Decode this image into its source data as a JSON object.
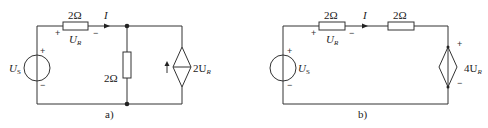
{
  "circuit_a": {
    "caption": "a)",
    "source": {
      "symbol": "U",
      "subscript": "S",
      "plus": "+",
      "minus": "−"
    },
    "series_resistor": {
      "value": "2Ω",
      "voltage_label": "U",
      "voltage_subscript": "R",
      "plus": "+",
      "minus": "−"
    },
    "current_label": "I",
    "shunt_resistor": {
      "value": "2Ω"
    },
    "dependent_source": {
      "type": "current",
      "label": "2U",
      "subscript": "R",
      "arrow": "↑"
    }
  },
  "circuit_b": {
    "caption": "b)",
    "source": {
      "symbol": "U",
      "subscript": "S",
      "plus": "+",
      "minus": "−"
    },
    "series_resistor_1": {
      "value": "2Ω",
      "voltage_label": "U",
      "voltage_subscript": "R",
      "plus": "+",
      "minus": "−"
    },
    "current_label": "I",
    "series_resistor_2": {
      "value": "2Ω"
    },
    "dependent_source": {
      "type": "voltage",
      "label": "4U",
      "subscript": "R",
      "plus": "+",
      "minus": "−"
    }
  }
}
